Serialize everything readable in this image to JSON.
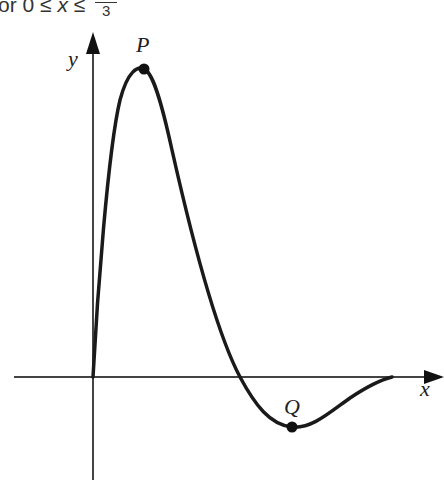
{
  "header": {
    "prefix": "or 0 ≤ ",
    "variable": "x",
    "relation": " ≤ ",
    "fraction_numerator": "",
    "fraction_denominator": "3"
  },
  "diagram": {
    "type": "function-graph",
    "axes": {
      "x_label": "x",
      "y_label": "y"
    },
    "points": [
      {
        "name": "P",
        "description": "local maximum",
        "px": [
          144,
          69
        ]
      },
      {
        "name": "Q",
        "description": "local minimum",
        "px": [
          292,
          427
        ]
      }
    ],
    "colors": {
      "curve": "#1a1a1a",
      "axes": "#444444",
      "background": "#ffffff"
    }
  }
}
